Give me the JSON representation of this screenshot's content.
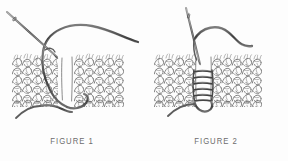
{
  "document": {
    "type": "instructional-illustration",
    "subject": "Mattress stitch seaming of knitted fabric",
    "panel_count": 2,
    "background_color": "#fdfdfd",
    "ink_color": "#5a5a5a",
    "line_color": "#4a4a4a"
  },
  "figures": [
    {
      "id": "figure-1",
      "caption": "FIGURE 1",
      "description": "Two knitted fabric edges held side by side with a threaded needle entering from the upper left and a loose loop of yarn arcing above the work.",
      "needle": {
        "orientation": "diagonal-from-upper-left",
        "tip_direction": "down-right",
        "visible": true
      },
      "yarn": {
        "path": "arc-over-top",
        "tail_direction": "lower-left",
        "loop_at_bottom": true
      },
      "fabric": {
        "pieces": 2,
        "gap": "vertical-center-seam",
        "stitch_rows": 5,
        "stitch_columns": 9
      }
    },
    {
      "id": "figure-2",
      "caption": "FIGURE 2",
      "description": "The same two knitted edges now joined with horizontal ladder rungs of the mattress stitch; the needle stands vertically and the yarn tail curves away to the right in an S shape.",
      "needle": {
        "orientation": "vertical",
        "tip_direction": "down",
        "visible": true
      },
      "yarn": {
        "path": "s-curve-to-right",
        "tail_direction": "right",
        "loop_at_bottom": true
      },
      "fabric": {
        "pieces": 2,
        "gap": "laced-center-seam",
        "stitch_rows": 5,
        "stitch_columns": 9,
        "ladder_rungs": 6
      }
    }
  ],
  "captions": {
    "figure_1_label": "FIGURE 1",
    "figure_2_label": "FIGURE 2"
  }
}
